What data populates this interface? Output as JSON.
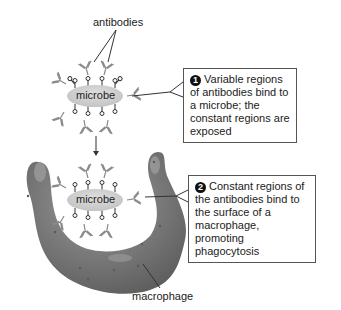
{
  "labels": {
    "antibodies": "antibodies",
    "macrophage": "macrophage",
    "microbe_top": "microbe",
    "microbe_bottom": "microbe"
  },
  "callouts": [
    {
      "number": "1",
      "text": "Variable regions of antibodies bind to a microbe; the constant regions are exposed"
    },
    {
      "number": "2",
      "text": "Constant regions of the antibodies bind to the surface of a macrophage, promoting phagocytosis"
    }
  ],
  "colors": {
    "microbe_fill": "#cfcfcf",
    "macrophage_fill": "#7a7a7a",
    "antibody_stroke": "#8a8a8a",
    "callout_border": "#555555",
    "number_badge": "#111111"
  }
}
